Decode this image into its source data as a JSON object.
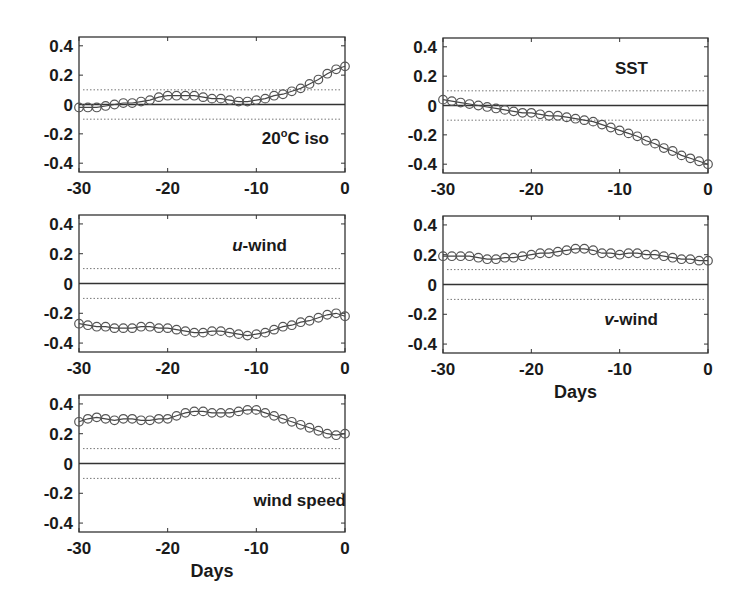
{
  "chart_data": [
    {
      "type": "line",
      "id": "iso20",
      "panel_label": {
        "main": "20",
        "sup": "o",
        "rest": "C iso"
      },
      "label_position": "bottom-right",
      "xlabel": "",
      "ylabel": "",
      "xlim": [
        -30,
        0
      ],
      "ylim": [
        -0.46,
        0.46
      ],
      "xticks": [
        -30,
        -20,
        -10,
        0
      ],
      "xtick_labels": [
        "-30",
        "-20",
        "-10",
        "0"
      ],
      "yticks": [
        0.4,
        0.2,
        0,
        -0.2,
        -0.4
      ],
      "ytick_labels": [
        "0.4",
        "0.2",
        "0",
        "-0.2",
        "-0.4"
      ],
      "reference_lines": {
        "zero": 0,
        "significance": [
          0.1,
          -0.1
        ]
      },
      "x": [
        -30,
        -29,
        -28,
        -27,
        -26,
        -25,
        -24,
        -23,
        -22,
        -21,
        -20,
        -19,
        -18,
        -17,
        -16,
        -15,
        -14,
        -13,
        -12,
        -11,
        -10,
        -9,
        -8,
        -7,
        -6,
        -5,
        -4,
        -3,
        -2,
        -1,
        0
      ],
      "values": [
        -0.02,
        -0.02,
        -0.02,
        -0.01,
        0.0,
        0.01,
        0.01,
        0.02,
        0.03,
        0.05,
        0.06,
        0.06,
        0.06,
        0.06,
        0.05,
        0.04,
        0.04,
        0.03,
        0.02,
        0.02,
        0.03,
        0.04,
        0.06,
        0.07,
        0.09,
        0.11,
        0.14,
        0.17,
        0.21,
        0.24,
        0.26,
        0.31
      ]
    },
    {
      "type": "line",
      "id": "sst",
      "panel_label": {
        "main": "SST",
        "sup": "",
        "rest": ""
      },
      "label_position": "top-right",
      "xlabel": "",
      "ylabel": "",
      "xlim": [
        -30,
        0
      ],
      "ylim": [
        -0.46,
        0.46
      ],
      "xticks": [
        -30,
        -20,
        -10,
        0
      ],
      "xtick_labels": [
        "-30",
        "-20",
        "-10",
        "0"
      ],
      "yticks": [
        0.4,
        0.2,
        0,
        -0.2,
        -0.4
      ],
      "ytick_labels": [
        "0.4",
        "0.2",
        "0",
        "-0.2",
        "-0.4"
      ],
      "reference_lines": {
        "zero": 0,
        "significance": [
          0.1,
          -0.1
        ]
      },
      "x": [
        -30,
        -29,
        -28,
        -27,
        -26,
        -25,
        -24,
        -23,
        -22,
        -21,
        -20,
        -19,
        -18,
        -17,
        -16,
        -15,
        -14,
        -13,
        -12,
        -11,
        -10,
        -9,
        -8,
        -7,
        -6,
        -5,
        -4,
        -3,
        -2,
        -1,
        0
      ],
      "values": [
        0.04,
        0.03,
        0.02,
        0.01,
        0.0,
        -0.01,
        -0.02,
        -0.03,
        -0.04,
        -0.05,
        -0.05,
        -0.06,
        -0.07,
        -0.07,
        -0.08,
        -0.09,
        -0.1,
        -0.11,
        -0.13,
        -0.15,
        -0.17,
        -0.19,
        -0.21,
        -0.24,
        -0.26,
        -0.29,
        -0.31,
        -0.34,
        -0.36,
        -0.38,
        -0.4
      ]
    },
    {
      "type": "line",
      "id": "uwind",
      "panel_label": {
        "main": "u",
        "sup": "",
        "rest": "-wind"
      },
      "label_italic_prefix": true,
      "label_position": "top-right",
      "xlabel": "",
      "ylabel": "",
      "xlim": [
        -30,
        0
      ],
      "ylim": [
        -0.46,
        0.46
      ],
      "xticks": [
        -30,
        -20,
        -10,
        0
      ],
      "xtick_labels": [
        "-30",
        "-20",
        "-10",
        "0"
      ],
      "yticks": [
        0.4,
        0.2,
        0,
        -0.2,
        -0.4
      ],
      "ytick_labels": [
        "0.4",
        "0.2",
        "0",
        "-0.2",
        "-0.4"
      ],
      "reference_lines": {
        "zero": 0,
        "significance": [
          0.1,
          -0.1
        ]
      },
      "x": [
        -30,
        -29,
        -28,
        -27,
        -26,
        -25,
        -24,
        -23,
        -22,
        -21,
        -20,
        -19,
        -18,
        -17,
        -16,
        -15,
        -14,
        -13,
        -12,
        -11,
        -10,
        -9,
        -8,
        -7,
        -6,
        -5,
        -4,
        -3,
        -2,
        -1,
        0
      ],
      "values": [
        -0.27,
        -0.28,
        -0.29,
        -0.29,
        -0.3,
        -0.3,
        -0.3,
        -0.29,
        -0.29,
        -0.3,
        -0.3,
        -0.31,
        -0.32,
        -0.33,
        -0.33,
        -0.32,
        -0.32,
        -0.33,
        -0.34,
        -0.35,
        -0.34,
        -0.33,
        -0.31,
        -0.29,
        -0.28,
        -0.26,
        -0.25,
        -0.23,
        -0.21,
        -0.2,
        -0.22
      ]
    },
    {
      "type": "line",
      "id": "vwind",
      "panel_label": {
        "main": "v",
        "sup": "",
        "rest": "-wind"
      },
      "label_italic_prefix": true,
      "label_position": "bottom-right",
      "xlabel": "Days",
      "ylabel": "",
      "xlim": [
        -30,
        0
      ],
      "ylim": [
        -0.46,
        0.46
      ],
      "xticks": [
        -30,
        -20,
        -10,
        0
      ],
      "xtick_labels": [
        "-30",
        "-20",
        "-10",
        "0"
      ],
      "yticks": [
        0.4,
        0.2,
        0,
        -0.2,
        -0.4
      ],
      "ytick_labels": [
        "0.4",
        "0.2",
        "0",
        "-0.2",
        "-0.4"
      ],
      "reference_lines": {
        "zero": 0,
        "significance": [
          0.1,
          -0.1
        ]
      },
      "x": [
        -30,
        -29,
        -28,
        -27,
        -26,
        -25,
        -24,
        -23,
        -22,
        -21,
        -20,
        -19,
        -18,
        -17,
        -16,
        -15,
        -14,
        -13,
        -12,
        -11,
        -10,
        -9,
        -8,
        -7,
        -6,
        -5,
        -4,
        -3,
        -2,
        -1,
        0
      ],
      "values": [
        0.19,
        0.19,
        0.19,
        0.19,
        0.18,
        0.17,
        0.17,
        0.18,
        0.18,
        0.19,
        0.2,
        0.21,
        0.21,
        0.22,
        0.23,
        0.24,
        0.24,
        0.23,
        0.21,
        0.21,
        0.2,
        0.21,
        0.21,
        0.2,
        0.2,
        0.19,
        0.18,
        0.17,
        0.17,
        0.16,
        0.16
      ]
    },
    {
      "type": "line",
      "id": "windspeed",
      "panel_label": {
        "main": "wind speed",
        "sup": "",
        "rest": ""
      },
      "label_position": "bottom-right",
      "xlabel": "Days",
      "ylabel": "",
      "xlim": [
        -30,
        0
      ],
      "ylim": [
        -0.46,
        0.46
      ],
      "xticks": [
        -30,
        -20,
        -10,
        0
      ],
      "xtick_labels": [
        "-30",
        "-20",
        "-10",
        "0"
      ],
      "yticks": [
        0.4,
        0.2,
        0,
        -0.2,
        -0.4
      ],
      "ytick_labels": [
        "0.4",
        "0.2",
        "0",
        "-0.2",
        "-0.4"
      ],
      "reference_lines": {
        "zero": 0,
        "significance": [
          0.1,
          -0.1
        ]
      },
      "x": [
        -30,
        -29,
        -28,
        -27,
        -26,
        -25,
        -24,
        -23,
        -22,
        -21,
        -20,
        -19,
        -18,
        -17,
        -16,
        -15,
        -14,
        -13,
        -12,
        -11,
        -10,
        -9,
        -8,
        -7,
        -6,
        -5,
        -4,
        -3,
        -2,
        -1,
        0
      ],
      "values": [
        0.28,
        0.3,
        0.31,
        0.3,
        0.29,
        0.3,
        0.3,
        0.29,
        0.29,
        0.3,
        0.3,
        0.32,
        0.34,
        0.35,
        0.35,
        0.34,
        0.34,
        0.34,
        0.35,
        0.36,
        0.36,
        0.34,
        0.32,
        0.3,
        0.28,
        0.26,
        0.24,
        0.22,
        0.2,
        0.19,
        0.2
      ]
    }
  ]
}
